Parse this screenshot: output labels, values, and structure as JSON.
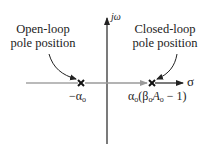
{
  "diagram": {
    "axes": {
      "imaginary_label": "jω",
      "real_label": "σ"
    },
    "open_loop": {
      "label_line1": "Open-loop",
      "label_line2": "pole position",
      "value": "−α",
      "value_sub": "o"
    },
    "closed_loop": {
      "label_line1": "Closed-loop",
      "label_line2": "pole position",
      "value_prefix": "α",
      "value_prefix_sub": "o",
      "value_paren_open": "(β",
      "value_beta_sub": "o",
      "value_A": "A",
      "value_A_sub": "o",
      "value_suffix": " − 1)"
    },
    "colors": {
      "axis": "#222222",
      "movement_arrow": "#9a9a9a",
      "pole_marker": "#111111"
    }
  }
}
